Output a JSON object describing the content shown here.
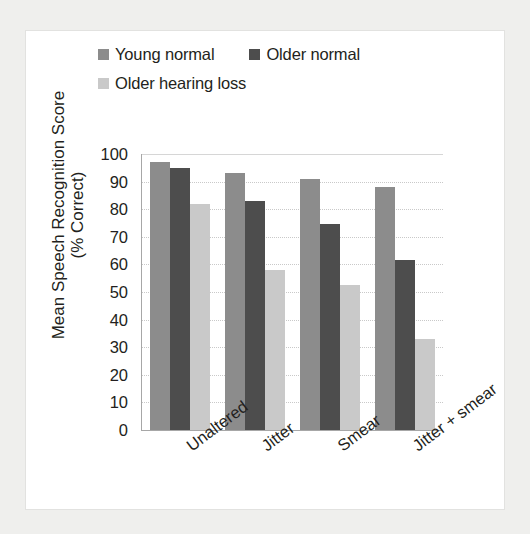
{
  "chart_data": {
    "type": "bar",
    "title": "",
    "xlabel": "",
    "ylabel_line1": "Mean Speech Recognition Score",
    "ylabel_line2": "(% Correct)",
    "categories": [
      "Unaltered",
      "Jitter",
      "Smear",
      "Jitter + smear"
    ],
    "series": [
      {
        "name": "Young normal",
        "color": "#8c8c8c",
        "values": [
          97,
          93,
          91,
          88
        ]
      },
      {
        "name": "Older normal",
        "color": "#4d4d4d",
        "values": [
          95,
          83,
          74.5,
          61.5
        ]
      },
      {
        "name": "Older hearing loss",
        "color": "#c9c9c9",
        "values": [
          82,
          58,
          52.5,
          33
        ]
      }
    ],
    "ylim": [
      0,
      100
    ],
    "yticks": [
      100,
      90,
      80,
      70,
      60,
      50,
      40,
      30,
      20,
      10,
      0
    ],
    "ytick_labels": [
      "100",
      "90",
      "80",
      "70",
      "60",
      "50",
      "40",
      "30",
      "20",
      "10",
      "0"
    ],
    "grid": true,
    "legend_position": "top-left",
    "bar_orientation": "vertical",
    "xtick_rotation": -37
  },
  "legend": {
    "rows": [
      [
        {
          "label": "Young normal",
          "color": "#8c8c8c"
        },
        {
          "label": "Older normal",
          "color": "#4d4d4d"
        }
      ],
      [
        {
          "label": "Older hearing loss",
          "color": "#c9c9c9"
        }
      ]
    ]
  },
  "colors": {
    "page_background": "#efefed",
    "card_background": "#ffffff",
    "axis": "#a7a7a7",
    "gridline": "#c9c9c9",
    "text": "#231f20"
  }
}
